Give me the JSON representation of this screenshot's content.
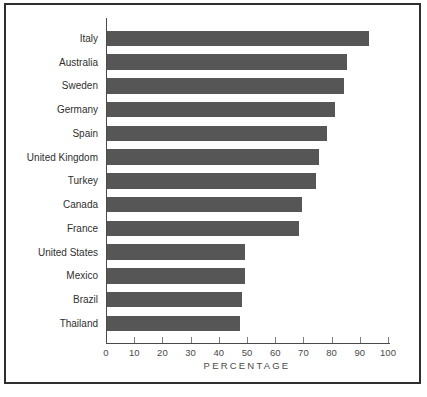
{
  "figure": {
    "background": "#ffffff",
    "frame_color": "#2e2e2e"
  },
  "chart_data": {
    "type": "bar",
    "orientation": "horizontal",
    "title": "",
    "xlabel": "PERCENTAGE",
    "ylabel": "",
    "categories": [
      "Italy",
      "Australia",
      "Sweden",
      "Germany",
      "Spain",
      "United Kingdom",
      "Turkey",
      "Canada",
      "France",
      "United States",
      "Mexico",
      "Brazil",
      "Thailand"
    ],
    "values": [
      93,
      85,
      84,
      81,
      78,
      75,
      74,
      69,
      68,
      49,
      49,
      48,
      47
    ],
    "xlim": [
      0,
      100
    ],
    "xticks": [
      0,
      10,
      20,
      30,
      40,
      50,
      60,
      70,
      80,
      90,
      100
    ],
    "grid": false,
    "legend": "none",
    "bar_color": "#565656",
    "axis_color": "#4a4a4a",
    "label_color": "#2f2f2f",
    "tick_label_color": "#4a4a4a"
  }
}
